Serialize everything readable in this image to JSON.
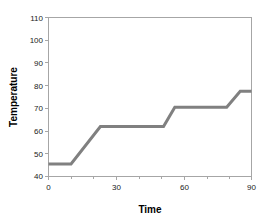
{
  "chart_data": {
    "type": "line",
    "title": "",
    "xlabel": "Time",
    "ylabel": "Temperature",
    "xlim": [
      0,
      90
    ],
    "ylim": [
      40,
      110
    ],
    "grid": false,
    "legend": false,
    "line_color": "#808080",
    "axis_color": "#a6a6a6",
    "text_color": "#1a1a1a",
    "x_major_ticks": [
      0,
      30,
      60,
      90
    ],
    "x_major_tick_labels": [
      "0",
      "30",
      "60",
      "90"
    ],
    "x_minor_ticks": [
      0,
      10,
      20,
      30,
      40,
      50,
      60,
      70,
      80,
      90
    ],
    "y_ticks": [
      40,
      50,
      60,
      70,
      80,
      90,
      100,
      110
    ],
    "y_tick_labels": [
      "40",
      "50",
      "60",
      "70",
      "80",
      "90",
      "100",
      "110"
    ],
    "series": [
      {
        "name": "Temperature",
        "x": [
          0,
          10,
          23,
          51,
          56,
          79,
          85,
          90
        ],
        "y": [
          45.5,
          45.5,
          62,
          62,
          70.5,
          70.5,
          77.5,
          77.5
        ]
      }
    ]
  }
}
